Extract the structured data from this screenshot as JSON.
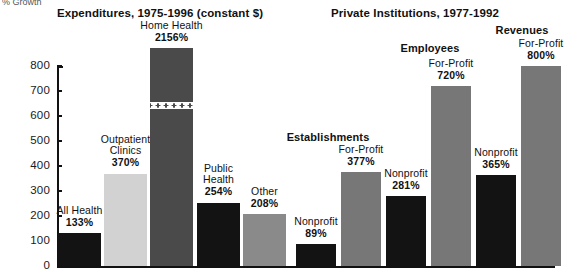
{
  "corner_note": "% Growth",
  "sections": [
    {
      "id": "expenditures",
      "title": "Expenditures, 1975-1996 (constant $)"
    },
    {
      "id": "private",
      "title": "Private Institutions, 1977-1992"
    }
  ],
  "group_titles": [
    {
      "id": "establishments",
      "label": "Establishments"
    },
    {
      "id": "employees",
      "label": "Employees"
    },
    {
      "id": "revenues",
      "label": "Revenues"
    }
  ],
  "axis": {
    "ticks": [
      "800",
      "700",
      "600",
      "500",
      "400",
      "300",
      "200",
      "100",
      "0"
    ],
    "min": 0,
    "max": 800,
    "step": 100
  },
  "colors": {
    "black": "#131313",
    "dark_gray": "#4a4a4a",
    "medium_gray": "#8a8a8a",
    "light_gray": "#d2d2d2",
    "gray": "#777777",
    "axis": "#111111",
    "background": "#ffffff"
  },
  "chart_data": {
    "type": "bar",
    "title": "% Growth",
    "xlabel": "",
    "ylabel": "",
    "ylim": [
      0,
      800
    ],
    "grid": false,
    "legend": "none",
    "note": "Home Health bar is truncated with an axis break; its true value of 2156% exceeds the 800 axis maximum.",
    "categories": [
      "All Health",
      "Outpatient Clinics",
      "Home Health",
      "Public Health",
      "Other",
      "Establishments Nonprofit",
      "Establishments For-Profit",
      "Employees Nonprofit",
      "Employees For-Profit",
      "Revenues Nonprofit",
      "Revenues For-Profit"
    ],
    "values": [
      133,
      370,
      2156,
      254,
      208,
      89,
      377,
      281,
      720,
      365,
      800
    ],
    "bars": [
      {
        "name": "All Health",
        "pct_label": "133%",
        "value": 133,
        "fill": "black",
        "section": "expenditures",
        "broken": false
      },
      {
        "name": "Outpatient\nClinics",
        "pct_label": "370%",
        "value": 370,
        "fill": "light_gray",
        "section": "expenditures",
        "broken": false
      },
      {
        "name": "Home Health",
        "pct_label": "2156%",
        "value": 2156,
        "fill": "dark_gray",
        "section": "expenditures",
        "broken": true
      },
      {
        "name": "Public\nHealth",
        "pct_label": "254%",
        "value": 254,
        "fill": "black",
        "section": "expenditures",
        "broken": false
      },
      {
        "name": "Other",
        "pct_label": "208%",
        "value": 208,
        "fill": "medium_gray",
        "section": "expenditures",
        "broken": false
      },
      {
        "name": "Nonprofit",
        "pct_label": "89%",
        "value": 89,
        "fill": "black",
        "section": "private",
        "group": "Establishments",
        "broken": false
      },
      {
        "name": "For-Profit",
        "pct_label": "377%",
        "value": 377,
        "fill": "gray",
        "section": "private",
        "group": "Establishments",
        "broken": false
      },
      {
        "name": "Nonprofit",
        "pct_label": "281%",
        "value": 281,
        "fill": "black",
        "section": "private",
        "group": "Employees",
        "broken": false
      },
      {
        "name": "For-Profit",
        "pct_label": "720%",
        "value": 720,
        "fill": "gray",
        "section": "private",
        "group": "Employees",
        "broken": false
      },
      {
        "name": "Nonprofit",
        "pct_label": "365%",
        "value": 365,
        "fill": "black",
        "section": "private",
        "group": "Revenues",
        "broken": false
      },
      {
        "name": "For-Profit",
        "pct_label": "800%",
        "value": 800,
        "fill": "gray",
        "section": "private",
        "group": "Revenues",
        "broken": false
      }
    ]
  }
}
